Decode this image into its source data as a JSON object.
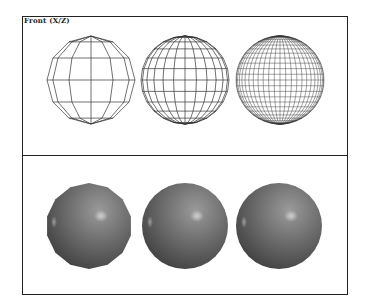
{
  "viewport": {
    "label": "Front (X/Z)"
  },
  "figure": {
    "top_panel": {
      "mode": "wireframe",
      "spheres": [
        {
          "name": "low-resolution",
          "cx": 68,
          "cy": 63,
          "r": 44,
          "lat": 6,
          "lon": 12
        },
        {
          "name": "medium-resolution",
          "cx": 162,
          "cy": 63,
          "r": 44,
          "lat": 12,
          "lon": 24
        },
        {
          "name": "high-resolution",
          "cx": 257,
          "cy": 63,
          "r": 44,
          "lat": 24,
          "lon": 48
        }
      ]
    },
    "bottom_panel": {
      "mode": "shaded",
      "spheres": [
        {
          "name": "low-resolution",
          "cx": 66,
          "cy": 70,
          "r": 43,
          "sides": 14
        },
        {
          "name": "medium-resolution",
          "cx": 162,
          "cy": 70,
          "r": 43,
          "sides": 0
        },
        {
          "name": "high-resolution",
          "cx": 256,
          "cy": 70,
          "r": 43,
          "sides": 0
        }
      ]
    },
    "colors": {
      "frame": "#222222",
      "wire": "#333333",
      "sphere_light": "#9a9a9a",
      "sphere_mid": "#6e6e6e",
      "sphere_dark": "#3a3a3a",
      "highlight": "#d8d8d8"
    }
  }
}
